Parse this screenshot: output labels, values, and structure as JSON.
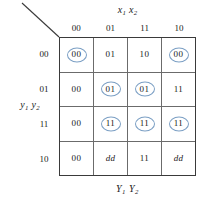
{
  "figure": {
    "type": "karnaugh-map",
    "top_label": "x1 x2",
    "left_label": "y1 y2",
    "bottom_label": "Y1 Y2",
    "column_headers": [
      "00",
      "01",
      "11",
      "10"
    ],
    "row_headers": [
      "00",
      "01",
      "11",
      "10"
    ],
    "circle_color": "#7b9fc4",
    "grid_color": "#6b6b6b"
  },
  "chart_data": {
    "type": "table",
    "title": "",
    "xlabel": "x1 x2",
    "ylabel": "y1 y2",
    "categories": [
      "00",
      "01",
      "11",
      "10"
    ],
    "rows": [
      "00",
      "01",
      "11",
      "10"
    ],
    "cells": [
      [
        {
          "value": "00",
          "circled": true,
          "dont_care": false
        },
        {
          "value": "01",
          "circled": false,
          "dont_care": false
        },
        {
          "value": "10",
          "circled": false,
          "dont_care": false
        },
        {
          "value": "00",
          "circled": true,
          "dont_care": false
        }
      ],
      [
        {
          "value": "00",
          "circled": false,
          "dont_care": false
        },
        {
          "value": "01",
          "circled": true,
          "dont_care": false
        },
        {
          "value": "01",
          "circled": true,
          "dont_care": false
        },
        {
          "value": "11",
          "circled": false,
          "dont_care": false
        }
      ],
      [
        {
          "value": "00",
          "circled": false,
          "dont_care": false
        },
        {
          "value": "11",
          "circled": true,
          "dont_care": false
        },
        {
          "value": "11",
          "circled": true,
          "dont_care": false
        },
        {
          "value": "11",
          "circled": true,
          "dont_care": false
        }
      ],
      [
        {
          "value": "00",
          "circled": false,
          "dont_care": false
        },
        {
          "value": "dd",
          "circled": false,
          "dont_care": true
        },
        {
          "value": "11",
          "circled": false,
          "dont_care": false
        },
        {
          "value": "dd",
          "circled": false,
          "dont_care": true
        }
      ]
    ]
  }
}
